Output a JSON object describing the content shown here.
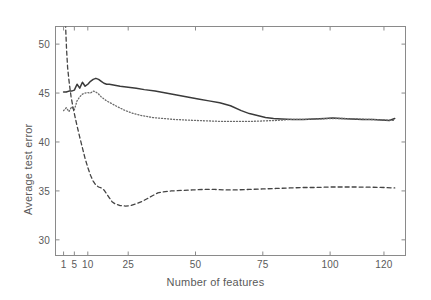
{
  "chart_data": {
    "type": "line",
    "title": "",
    "xlabel": "Number of features",
    "ylabel": "Average test error",
    "xlim": [
      -2,
      128
    ],
    "ylim": [
      28.4,
      51.8
    ],
    "grid": false,
    "legend": "none",
    "xticks": [
      1,
      5,
      10,
      25,
      50,
      75,
      100,
      120
    ],
    "xtick_labels": [
      "1",
      "5",
      "10",
      "25",
      "50",
      "75",
      "100",
      "120"
    ],
    "yticks": [
      30,
      35,
      40,
      45,
      50
    ],
    "ytick_labels": [
      "30",
      "35",
      "40",
      "45",
      "50"
    ],
    "series": [
      {
        "name": "solid-curve",
        "style": "solid",
        "color": "#3a3a3a",
        "x": [
          1,
          2,
          3,
          4,
          5,
          6,
          7,
          8,
          9,
          10,
          11,
          12,
          13,
          14,
          15,
          16,
          17,
          18,
          19,
          20,
          22,
          25,
          28,
          31,
          35,
          39,
          43,
          47,
          51,
          55,
          59,
          63,
          67,
          70,
          73,
          76,
          79,
          82,
          86,
          90,
          94,
          98,
          101,
          104,
          108,
          112,
          116,
          119,
          122,
          124
        ],
        "y": [
          45.1,
          45.1,
          45.2,
          45.2,
          45.3,
          45.9,
          45.5,
          46.1,
          45.7,
          45.9,
          46.2,
          46.4,
          46.5,
          46.4,
          46.2,
          46.0,
          45.9,
          45.9,
          45.85,
          45.8,
          45.7,
          45.6,
          45.5,
          45.35,
          45.2,
          45.0,
          44.8,
          44.6,
          44.4,
          44.2,
          44.0,
          43.7,
          43.2,
          42.9,
          42.7,
          42.5,
          42.4,
          42.35,
          42.3,
          42.3,
          42.35,
          42.4,
          42.45,
          42.4,
          42.35,
          42.3,
          42.3,
          42.25,
          42.2,
          42.4
        ]
      },
      {
        "name": "dotted-curve",
        "style": "dotted",
        "color": "#6a6a6a",
        "x": [
          1,
          2,
          3,
          4,
          5,
          6,
          7,
          8,
          9,
          10,
          11,
          12,
          13,
          14,
          15,
          17,
          19,
          21,
          24,
          27,
          30,
          34,
          38,
          42,
          46,
          50,
          55,
          60,
          65,
          70,
          75,
          80,
          85,
          90,
          95,
          100,
          105,
          110,
          115,
          120,
          124
        ],
        "y": [
          43.2,
          43.5,
          43.1,
          43.6,
          43.3,
          44.2,
          44.6,
          44.9,
          45.0,
          45.05,
          45.0,
          45.2,
          45.1,
          44.9,
          44.6,
          44.2,
          43.9,
          43.6,
          43.2,
          42.9,
          42.7,
          42.5,
          42.4,
          42.3,
          42.25,
          42.2,
          42.15,
          42.1,
          42.1,
          42.1,
          42.15,
          42.2,
          42.3,
          42.3,
          42.35,
          42.4,
          42.4,
          42.35,
          42.3,
          42.25,
          42.2
        ]
      },
      {
        "name": "dashed-curve",
        "style": "dashed",
        "color": "#444444",
        "x": [
          1.0,
          1.2,
          1.5,
          1.8,
          2.1,
          2.5,
          3.0,
          3.4,
          3.8,
          4.2,
          4.6,
          5.0,
          5.4,
          5.8,
          6.3,
          7,
          8,
          9,
          10,
          11,
          12,
          13,
          14,
          15,
          16,
          17,
          18,
          19,
          20,
          22,
          24,
          26,
          28,
          30,
          32,
          34,
          36,
          38,
          41,
          45,
          49,
          53,
          57,
          61,
          65,
          70,
          75,
          80,
          85,
          90,
          95,
          100,
          105,
          110,
          115,
          120,
          124
        ],
        "y": [
          60.0,
          57.0,
          54.0,
          51.5,
          49.5,
          47.6,
          46.3,
          45.4,
          44.6,
          44.0,
          43.4,
          42.9,
          42.4,
          41.9,
          41.3,
          40.5,
          39.4,
          38.3,
          37.4,
          36.6,
          36.0,
          35.6,
          35.4,
          35.3,
          35.1,
          34.7,
          34.3,
          33.9,
          33.7,
          33.5,
          33.45,
          33.5,
          33.7,
          33.9,
          34.2,
          34.5,
          34.8,
          34.9,
          35.0,
          35.05,
          35.1,
          35.15,
          35.15,
          35.1,
          35.1,
          35.15,
          35.2,
          35.25,
          35.3,
          35.35,
          35.35,
          35.4,
          35.4,
          35.4,
          35.38,
          35.35,
          35.3
        ]
      }
    ]
  },
  "axes": {
    "box_color": "#8a8a8a"
  }
}
